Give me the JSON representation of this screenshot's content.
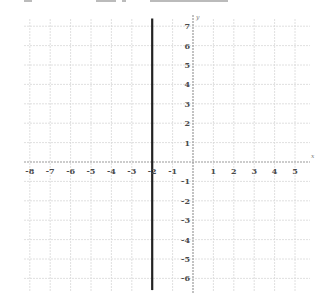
{
  "chart_data": {
    "type": "line",
    "title": "",
    "xlabel": "x",
    "ylabel": "y",
    "xlim": [
      -8,
      5
    ],
    "ylim": [
      -6,
      7
    ],
    "x_ticks": [
      -8,
      -7,
      -6,
      -5,
      -4,
      -3,
      -2,
      -1,
      1,
      2,
      3,
      4,
      5
    ],
    "y_ticks": [
      7,
      6,
      5,
      4,
      3,
      2,
      1,
      -1,
      -2,
      -3,
      -4,
      -5,
      -6
    ],
    "grid": true,
    "series": [
      {
        "name": "x = -2",
        "kind": "vertical-line",
        "x": [
          -2,
          -2
        ],
        "y": [
          -6.6,
          7.4
        ],
        "color": "#222222"
      }
    ]
  },
  "colors": {
    "grid": "#d8d8d8",
    "axis": "#9a9a9a",
    "line": "#222222",
    "tick_text": "#4a4a4a"
  },
  "header": {
    "cut_off_text": true
  }
}
